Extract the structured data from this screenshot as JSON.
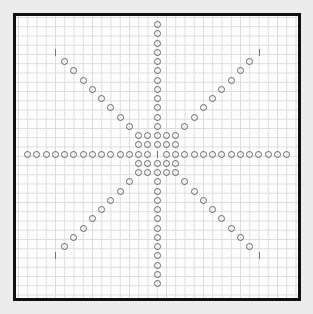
{
  "board": {
    "cell_size": 9.25,
    "center_px": [
      157,
      154
    ],
    "colors": {
      "border": "#111111",
      "grid": "#dcdcdc",
      "piece_outline": "#6a6a6a",
      "tick": "#777777",
      "background": "#ececec"
    },
    "center_block_radius": 2,
    "arms": {
      "horizontal": {
        "from": -14,
        "to": 14
      },
      "vertical": {
        "from": -14,
        "to": 14
      },
      "diagonals": {
        "from": 3,
        "to": 10,
        "tick_at": 11
      }
    },
    "center_tick": true
  }
}
